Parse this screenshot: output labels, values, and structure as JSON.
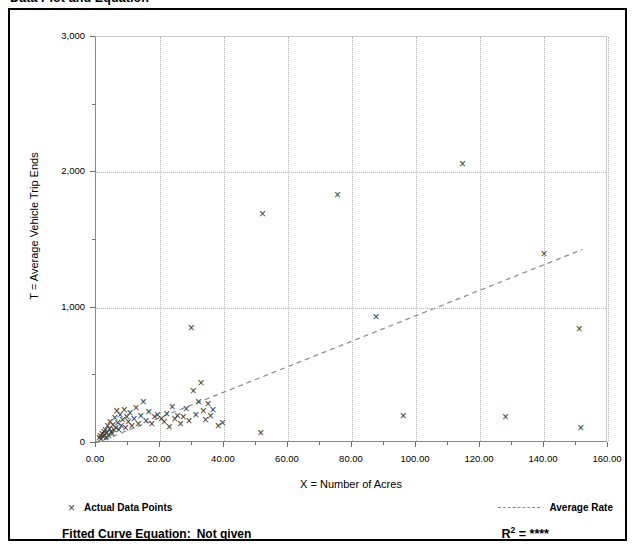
{
  "page": {
    "title": "Data Plot and Equation"
  },
  "axes": {
    "x_title": "X = Number of Acres",
    "y_title": "T = Average Vehicle Trip Ends"
  },
  "legend": {
    "data_points_label": "Actual Data Points",
    "data_points_marker": "cross-marker-icon",
    "average_rate_label": "Average Rate",
    "average_rate_marker": "dashed-line-icon"
  },
  "footer": {
    "equation_label": "Fitted Curve Equation:",
    "equation_value": "Not given",
    "r2_label": "R",
    "r2_sup": "2",
    "r2_eq": "=",
    "r2_value": "****"
  },
  "colors": {
    "axis": "#8a8a8a",
    "grid": "#b4b4b4",
    "marker": "#3a3a3a",
    "trend": "#8a8a8a",
    "frame": "#000000",
    "text": "#000000"
  },
  "chart_data": {
    "type": "scatter",
    "title": "Data Plot and Equation",
    "xlabel": "X = Number of Acres",
    "ylabel": "T = Average Vehicle Trip Ends",
    "xlim": [
      0,
      160
    ],
    "ylim": [
      0,
      3000
    ],
    "xticks": [
      0,
      20,
      40,
      60,
      80,
      100,
      120,
      140,
      160
    ],
    "xticklabels": [
      "0.00",
      "20.00",
      "40.00",
      "60.00",
      "80.00",
      "100.00",
      "120.00",
      "140.00",
      "160.00"
    ],
    "yticks": [
      0,
      1000,
      2000,
      3000
    ],
    "yticklabels": [
      "0",
      "1,000",
      "2,000",
      "3,000"
    ],
    "yminorticks": [
      500,
      1500,
      2500
    ],
    "grid": true,
    "grid_style": "dotted",
    "legend_position": "below-axes",
    "series": [
      {
        "name": "Actual Data Points",
        "type": "scatter",
        "marker": "x",
        "points": [
          [
            1.0,
            30
          ],
          [
            1.3,
            45
          ],
          [
            1.6,
            25
          ],
          [
            1.9,
            60
          ],
          [
            2.2,
            40
          ],
          [
            2.5,
            80
          ],
          [
            2.6,
            55
          ],
          [
            2.9,
            95
          ],
          [
            3.1,
            35
          ],
          [
            3.4,
            70
          ],
          [
            3.6,
            120
          ],
          [
            3.9,
            50
          ],
          [
            4.2,
            100
          ],
          [
            4.4,
            150
          ],
          [
            4.7,
            75
          ],
          [
            5.0,
            60
          ],
          [
            5.3,
            130
          ],
          [
            5.6,
            90
          ],
          [
            5.9,
            180
          ],
          [
            6.2,
            110
          ],
          [
            6.5,
            230
          ],
          [
            6.8,
            145
          ],
          [
            7.1,
            95
          ],
          [
            7.5,
            200
          ],
          [
            7.9,
            125
          ],
          [
            8.3,
            165
          ],
          [
            8.8,
            240
          ],
          [
            9.2,
            105
          ],
          [
            9.6,
            190
          ],
          [
            10.1,
            150
          ],
          [
            10.6,
            215
          ],
          [
            11.2,
            120
          ],
          [
            11.9,
            175
          ],
          [
            12.5,
            255
          ],
          [
            13.2,
            140
          ],
          [
            14.0,
            195
          ],
          [
            14.8,
            300
          ],
          [
            15.6,
            160
          ],
          [
            16.5,
            225
          ],
          [
            17.4,
            135
          ],
          [
            18.3,
            185
          ],
          [
            19.2,
            205
          ],
          [
            20.4,
            175
          ],
          [
            21.3,
            150
          ],
          [
            22.1,
            210
          ],
          [
            22.9,
            115
          ],
          [
            23.8,
            265
          ],
          [
            24.6,
            170
          ],
          [
            25.5,
            195
          ],
          [
            26.4,
            140
          ],
          [
            27.3,
            185
          ],
          [
            28.2,
            250
          ],
          [
            29.1,
            160
          ],
          [
            29.8,
            845
          ],
          [
            30.4,
            380
          ],
          [
            31.2,
            205
          ],
          [
            32.0,
            300
          ],
          [
            32.8,
            440
          ],
          [
            33.5,
            230
          ],
          [
            34.2,
            165
          ],
          [
            35.0,
            285
          ],
          [
            35.8,
            195
          ],
          [
            36.6,
            240
          ],
          [
            38.2,
            120
          ],
          [
            39.5,
            145
          ],
          [
            51.5,
            70
          ],
          [
            52.0,
            1690
          ],
          [
            75.5,
            1830
          ],
          [
            87.5,
            930
          ],
          [
            96.0,
            195
          ],
          [
            114.5,
            2060
          ],
          [
            128.0,
            190
          ],
          [
            140.0,
            1390
          ],
          [
            151.0,
            840
          ],
          [
            151.5,
            105
          ]
        ]
      },
      {
        "name": "Average Rate",
        "type": "line",
        "style": "dashed",
        "points": [
          [
            0,
            0
          ],
          [
            152,
            1430
          ]
        ],
        "slope": 9.4,
        "intercept": 0
      }
    ]
  }
}
